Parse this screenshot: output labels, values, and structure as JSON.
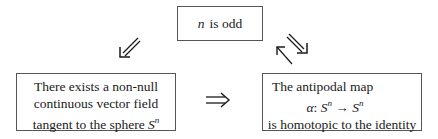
{
  "diagram": {
    "top_box": {
      "var": "n",
      "text": "is odd"
    },
    "left_box": {
      "lines": [
        "There exists a non-null",
        "continuous vector field",
        "tangent to the sphere"
      ],
      "sphere_symbol": "S",
      "sphere_exponent": "n"
    },
    "right_box": {
      "line1": "The antipodal map",
      "map_alpha": "α",
      "map_colon": ":",
      "map_domain": "S",
      "map_arrow": "→",
      "map_codomain": "S",
      "exponent": "n",
      "line3": "is homotopic to the identity"
    },
    "arrows": [
      {
        "name": "top-to-left",
        "type": "double-arrow",
        "direction": "down-left"
      },
      {
        "name": "top-to-right",
        "type": "double-arrow",
        "direction": "down-right"
      },
      {
        "name": "right-to-top",
        "type": "single-arrow",
        "direction": "up-left"
      },
      {
        "name": "left-to-right",
        "type": "double-arrow",
        "direction": "right",
        "glyph": "⇒"
      }
    ]
  }
}
